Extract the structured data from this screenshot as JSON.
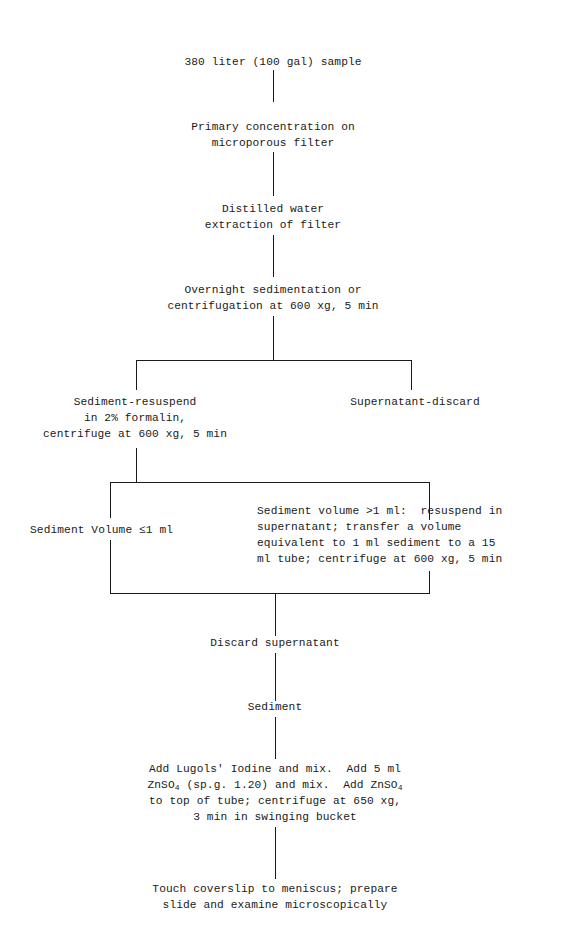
{
  "diagram": {
    "type": "flowchart",
    "nodes": {
      "sample": "380 liter (100 gal) sample",
      "primary_concentration": [
        "Primary concentration on",
        "microporous filter"
      ],
      "extraction": [
        "Distilled water",
        "extraction of filter"
      ],
      "sedimentation": [
        "Overnight sedimentation or",
        "centrifugation at 600 xg, 5 min"
      ],
      "sediment_resuspend": [
        "Sediment-resuspend",
        "in 2% formalin,",
        "centrifuge at 600 xg, 5 min"
      ],
      "supernatant_discard": "Supernatant-discard",
      "volume_small": "Sediment Volume ≤1 ml",
      "volume_large": [
        "Sediment volume >1 ml:  resuspend in",
        "supernatant; transfer a volume",
        "equivalent to 1 ml sediment to a 15",
        "ml tube; centrifuge at 600 xg, 5 min"
      ],
      "discard_supernatant": "Discard supernatant",
      "sediment": "Sediment",
      "flotation": {
        "line1": "Add Lugols' Iodine and mix.  Add 5 ml",
        "line2_a": "ZnSO",
        "line2_sub": "4",
        "line2_b": " (sp.g. 1.20) and mix.  Add ZnSO",
        "line2_sub2": "4",
        "line3": "to top of tube; centrifuge at 650 xg,",
        "line4": "3 min in swinging bucket"
      },
      "examine": [
        "Touch coverslip to meniscus; prepare",
        "slide and examine microscopically"
      ]
    }
  }
}
